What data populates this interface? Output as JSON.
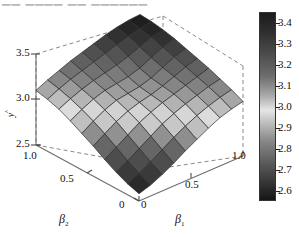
{
  "figure": {
    "top_fragment": "▁▁ ▁▁▁▁  ▁▁ ▁▁▁▁▁▁",
    "background": "#ffffff"
  },
  "axes": {
    "x": {
      "name": "beta-1",
      "label": "β",
      "label_sub": "1",
      "ticks": [
        "0",
        "0.5",
        "1.0"
      ],
      "range": [
        0,
        1
      ]
    },
    "y": {
      "name": "beta-2",
      "label": "β",
      "label_sub": "2",
      "ticks": [
        "1.0",
        "0.5",
        "0"
      ],
      "range": [
        0,
        1
      ]
    },
    "z": {
      "name": "response",
      "label": "y",
      "label_sup": "^",
      "ticks": [
        "2.5",
        "3.0",
        "3.5"
      ],
      "range": [
        2.5,
        3.5
      ]
    }
  },
  "colorbar": {
    "name": "surface-colorbar",
    "ticks": [
      "3.4",
      "3.3",
      "3.2",
      "3.1",
      "3.0",
      "2.9",
      "2.8",
      "2.7",
      "2.6"
    ],
    "min": 2.55,
    "max": 3.45,
    "orientation": "vertical",
    "stops": [
      {
        "pos": 0.0,
        "color": "#1c1c1c"
      },
      {
        "pos": 0.1,
        "color": "#2e2e2e"
      },
      {
        "pos": 0.22,
        "color": "#4c4c4c"
      },
      {
        "pos": 0.34,
        "color": "#6e6e6e"
      },
      {
        "pos": 0.44,
        "color": "#a8a8a8"
      },
      {
        "pos": 0.52,
        "color": "#e6e6e6"
      },
      {
        "pos": 0.58,
        "color": "#c2c2c2"
      },
      {
        "pos": 0.68,
        "color": "#8a8a8a"
      },
      {
        "pos": 0.78,
        "color": "#636363"
      },
      {
        "pos": 0.88,
        "color": "#3f3f3f"
      },
      {
        "pos": 1.0,
        "color": "#151515"
      }
    ]
  },
  "chart_data": {
    "type": "heatmap",
    "title": "",
    "xlabel": "β1",
    "ylabel": "β2",
    "zlabel": "y-hat",
    "xlim": [
      0,
      1
    ],
    "ylim": [
      0,
      1
    ],
    "zlim": [
      2.5,
      3.5
    ],
    "grid": true,
    "legend": "colorbar-right",
    "x": [
      0.05,
      0.15,
      0.25,
      0.35,
      0.45,
      0.55,
      0.65,
      0.75,
      0.85,
      0.95
    ],
    "y": [
      0.05,
      0.15,
      0.25,
      0.35,
      0.45,
      0.55,
      0.65,
      0.75,
      0.85,
      0.95
    ],
    "values": [
      [
        2.58,
        2.62,
        2.68,
        2.75,
        2.83,
        2.9,
        2.97,
        3.03,
        3.07,
        3.1
      ],
      [
        2.62,
        2.68,
        2.75,
        2.83,
        2.91,
        2.98,
        3.04,
        3.09,
        3.13,
        3.16
      ],
      [
        2.68,
        2.75,
        2.83,
        2.91,
        2.99,
        3.05,
        3.1,
        3.14,
        3.18,
        3.21
      ],
      [
        2.75,
        2.83,
        2.91,
        2.99,
        3.05,
        3.1,
        3.14,
        3.18,
        3.22,
        3.26
      ],
      [
        2.83,
        2.91,
        2.99,
        3.05,
        3.09,
        3.12,
        3.16,
        3.21,
        3.26,
        3.3
      ],
      [
        2.9,
        2.98,
        3.05,
        3.1,
        3.12,
        3.14,
        3.18,
        3.24,
        3.3,
        3.34
      ],
      [
        2.97,
        3.04,
        3.1,
        3.14,
        3.16,
        3.18,
        3.22,
        3.28,
        3.34,
        3.38
      ],
      [
        3.03,
        3.09,
        3.14,
        3.18,
        3.21,
        3.24,
        3.28,
        3.33,
        3.38,
        3.41
      ],
      [
        3.07,
        3.13,
        3.18,
        3.22,
        3.26,
        3.3,
        3.34,
        3.38,
        3.41,
        3.43
      ],
      [
        3.1,
        3.16,
        3.21,
        3.26,
        3.3,
        3.34,
        3.38,
        3.41,
        3.43,
        3.44
      ]
    ]
  }
}
